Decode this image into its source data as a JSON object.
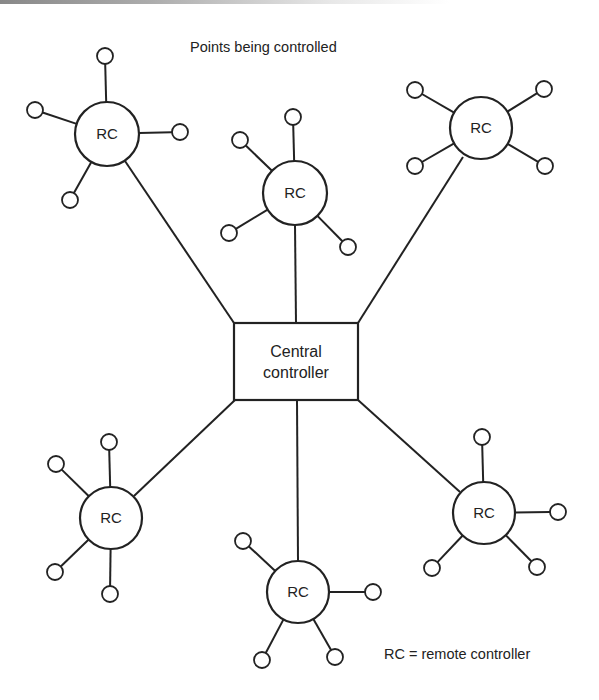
{
  "diagram": {
    "title": "Points being controlled",
    "legend": "RC = remote controller",
    "central": {
      "line1": "Central",
      "line2": "controller",
      "x": 234,
      "y": 323,
      "w": 124,
      "h": 77
    },
    "colors": {
      "stroke": "#222222",
      "background": "#ffffff"
    },
    "remote_controllers": [
      {
        "id": "rc-top-left",
        "label": "RC",
        "cx": 107,
        "cy": 134,
        "r": 32,
        "link": [
          125,
          161,
          234,
          323
        ],
        "points": [
          [
            105,
            56
          ],
          [
            35,
            110
          ],
          [
            180,
            132
          ],
          [
            70,
            200
          ]
        ]
      },
      {
        "id": "rc-top-middle",
        "label": "RC",
        "cx": 295,
        "cy": 193,
        "r": 32,
        "link": [
          295,
          225,
          296,
          323
        ],
        "points": [
          [
            293,
            117
          ],
          [
            240,
            140
          ],
          [
            229,
            233
          ],
          [
            348,
            247
          ]
        ]
      },
      {
        "id": "rc-top-right",
        "label": "RC",
        "cx": 481,
        "cy": 128,
        "r": 31,
        "link": [
          463,
          157,
          358,
          323
        ],
        "points": [
          [
            415,
            90
          ],
          [
            544,
            89
          ],
          [
            415,
            166
          ],
          [
            545,
            166
          ]
        ]
      },
      {
        "id": "rc-bottom-left",
        "label": "RC",
        "cx": 111,
        "cy": 518,
        "r": 31,
        "link": [
          134,
          496,
          235,
          400
        ],
        "points": [
          [
            109,
            442
          ],
          [
            56,
            464
          ],
          [
            55,
            572
          ],
          [
            110,
            594
          ]
        ]
      },
      {
        "id": "rc-bottom-middle",
        "label": "RC",
        "cx": 298,
        "cy": 592,
        "r": 31,
        "link": [
          298,
          561,
          297,
          400
        ],
        "points": [
          [
            243,
            541
          ],
          [
            373,
            592
          ],
          [
            262,
            660
          ],
          [
            335,
            657
          ]
        ]
      },
      {
        "id": "rc-bottom-right",
        "label": "RC",
        "cx": 484,
        "cy": 513,
        "r": 31,
        "link": [
          460,
          492,
          358,
          400
        ],
        "points": [
          [
            482,
            437
          ],
          [
            558,
            512
          ],
          [
            432,
            568
          ],
          [
            537,
            567
          ]
        ]
      }
    ]
  }
}
